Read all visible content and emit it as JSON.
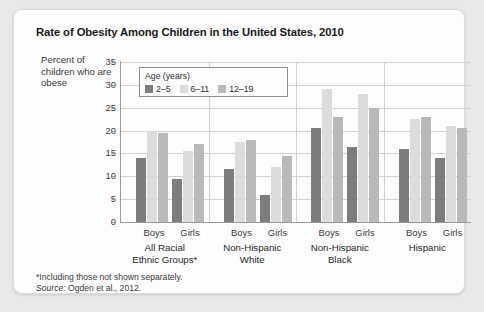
{
  "card": {
    "title": "Rate of Obesity Among Children in the United States, 2010",
    "ylabel": "Percent of children who are obese",
    "footnote_line1": "*Including those not shown separately.",
    "footnote_source_label": "Source:",
    "footnote_source_text": " Ogden et al., 2012."
  },
  "legend": {
    "title": "Age (years)",
    "items": [
      {
        "label": "2–5",
        "color": "#7d7d7d"
      },
      {
        "label": "6–11",
        "color": "#dcdcdc"
      },
      {
        "label": "12–19",
        "color": "#b9b9b9"
      }
    ]
  },
  "chart_data": {
    "type": "bar",
    "title": "Rate of Obesity Among Children in the United States, 2010",
    "xlabel": "",
    "ylabel": "Percent of children who are obese",
    "ylim": [
      0,
      35
    ],
    "yticks": [
      "0",
      "5",
      "10",
      "15",
      "20",
      "25",
      "30",
      "35"
    ],
    "grid": true,
    "legend_position": "inside-top-left",
    "categories": [
      "All Racial Ethnic Groups* — Boys",
      "All Racial Ethnic Groups* — Girls",
      "Non-Hispanic White — Boys",
      "Non-Hispanic White — Girls",
      "Non-Hispanic Black — Boys",
      "Non-Hispanic Black — Girls",
      "Hispanic — Boys",
      "Hispanic — Girls"
    ],
    "series": [
      {
        "name": "2–5",
        "color": "#7d7d7d",
        "values": [
          14,
          9.5,
          11.5,
          6,
          20.5,
          16.5,
          16,
          14
        ]
      },
      {
        "name": "6–11",
        "color": "#dcdcdc",
        "values": [
          20,
          15.5,
          17.5,
          12,
          29,
          28,
          22.5,
          21
        ]
      },
      {
        "name": "12–19",
        "color": "#b9b9b9",
        "values": [
          19.5,
          17,
          18,
          14.5,
          23,
          25,
          23,
          20.5
        ]
      }
    ],
    "groups": [
      {
        "label_line1": "All Racial",
        "label_line2": "Ethnic Groups*",
        "sexes": [
          "Boys",
          "Girls"
        ]
      },
      {
        "label_line1": "Non-Hispanic",
        "label_line2": "White",
        "sexes": [
          "Boys",
          "Girls"
        ]
      },
      {
        "label_line1": "Non-Hispanic",
        "label_line2": "Black",
        "sexes": [
          "Boys",
          "Girls"
        ]
      },
      {
        "label_line1": "Hispanic",
        "label_line2": "",
        "sexes": [
          "Boys",
          "Girls"
        ]
      }
    ]
  }
}
